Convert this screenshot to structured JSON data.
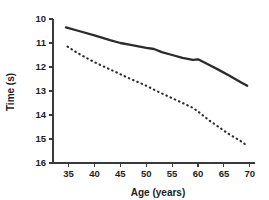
{
  "chart_data": {
    "type": "line",
    "title": "",
    "xlabel": "Age (years)",
    "ylabel": "Time (s)",
    "xlim": [
      32,
      71
    ],
    "ylim": [
      10,
      16
    ],
    "y_inverted": true,
    "grid": false,
    "legend": "none",
    "xticks": [
      35,
      40,
      45,
      50,
      55,
      60,
      65,
      70
    ],
    "xtick_labels": [
      "35",
      "40",
      "45",
      "50",
      "55",
      "60",
      "65",
      "70"
    ],
    "yticks": [
      10,
      11,
      12,
      13,
      14,
      15,
      16
    ],
    "ytick_labels": [
      "10",
      "11",
      "12",
      "13",
      "14",
      "15",
      "16"
    ],
    "series": [
      {
        "name": "solid-line",
        "style": "solid",
        "color": "#2b2b2b",
        "x": [
          34.5,
          37,
          40,
          43,
          45,
          47,
          50,
          51.5,
          53,
          55,
          57,
          59,
          60,
          62,
          64,
          66,
          68,
          69.5
        ],
        "values": [
          10.35,
          10.5,
          10.68,
          10.88,
          11.0,
          11.08,
          11.2,
          11.25,
          11.38,
          11.5,
          11.62,
          11.7,
          11.68,
          11.9,
          12.12,
          12.35,
          12.6,
          12.78
        ]
      },
      {
        "name": "dotted-line",
        "style": "dotted",
        "color": "#2b2b2b",
        "x": [
          34.8,
          37,
          40,
          43,
          45,
          47,
          50,
          52,
          55,
          57,
          59,
          60,
          62,
          64,
          66,
          68,
          69.5
        ],
        "values": [
          11.15,
          11.45,
          11.8,
          12.1,
          12.3,
          12.5,
          12.78,
          13.0,
          13.3,
          13.5,
          13.7,
          13.85,
          14.2,
          14.5,
          14.8,
          15.05,
          15.28
        ]
      }
    ]
  }
}
